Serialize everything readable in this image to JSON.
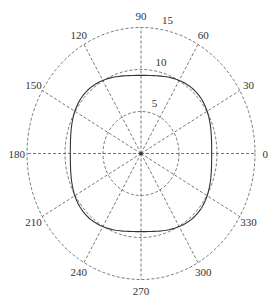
{
  "chart_data": {
    "type": "polar",
    "title": "",
    "angle_unit": "degrees",
    "angle_ticks": [
      0,
      30,
      60,
      90,
      120,
      150,
      180,
      210,
      240,
      270,
      300,
      330
    ],
    "angle_tick_labels": [
      "0",
      "30",
      "60",
      "90",
      "120",
      "150",
      "180",
      "210",
      "240",
      "270",
      "300",
      "330"
    ],
    "radial_ticks": [
      5,
      10,
      15
    ],
    "radial_tick_labels": [
      "5",
      "10",
      "15"
    ],
    "rlim": [
      0,
      15
    ],
    "grid": true,
    "grid_style": "dashed",
    "series": [
      {
        "name": "r(theta)",
        "description": "Near-circular curve with four-fold ripple: minima ~9.3 at 0/90/180/270 deg, maxima ~10.3 at 45/135/225/315 deg, crossing r=10 near every 30 deg spoke",
        "theta": [
          0,
          15,
          30,
          45,
          60,
          75,
          90,
          105,
          120,
          135,
          150,
          165,
          180,
          195,
          210,
          225,
          240,
          255,
          270,
          285,
          300,
          315,
          330,
          345,
          360
        ],
        "r": [
          9.3,
          9.55,
          10.05,
          10.3,
          10.05,
          9.55,
          9.3,
          9.55,
          10.05,
          10.3,
          10.05,
          9.55,
          9.3,
          9.55,
          10.05,
          10.3,
          10.05,
          9.55,
          9.3,
          9.55,
          10.05,
          10.3,
          10.05,
          9.55,
          9.3
        ]
      }
    ],
    "legend": null
  },
  "style": {
    "grid_color": "#555555",
    "curve_color": "#333333",
    "background": "#ffffff"
  }
}
